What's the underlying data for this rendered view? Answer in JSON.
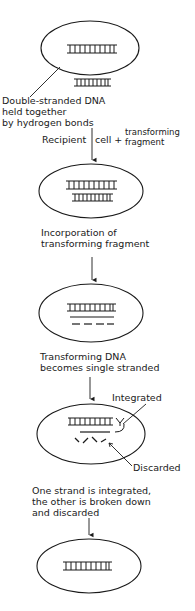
{
  "diagram": {
    "steps": [
      {
        "id": "step1",
        "caption_lines": [
          "Double-stranded DNA",
          "held together",
          "by hydrogen bonds"
        ],
        "note": {
          "left": "Recipient",
          "middle": "cell +",
          "right_top": "transforming",
          "right_bottom": "fragment"
        }
      },
      {
        "id": "step2",
        "caption_lines": [
          "Incorporation of",
          "transforming fragment"
        ]
      },
      {
        "id": "step3",
        "caption_lines": [
          "Transforming DNA",
          "becomes single stranded"
        ]
      },
      {
        "id": "step4",
        "callouts": {
          "integrated": "Integrated",
          "discarded": "Discarded"
        },
        "caption_lines": [
          "One strand is integrated,",
          "the other is broken down",
          "and discarded"
        ]
      },
      {
        "id": "step5",
        "caption_lines": []
      }
    ],
    "colors": {
      "ink": "#1a1a1a",
      "background": "#ffffff"
    }
  }
}
